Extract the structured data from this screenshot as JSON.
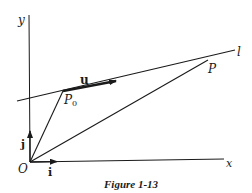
{
  "figure": {
    "caption": "Figure 1-13",
    "axes": {
      "x_label": "x",
      "y_label": "y",
      "origin_label": "O"
    },
    "unit_vectors": {
      "i_label": "i",
      "j_label": "j"
    },
    "line": {
      "label": "l",
      "direction_vector_label": "u"
    },
    "points": {
      "p0_label": "P",
      "p0_subscript": "0",
      "p_label": "P"
    },
    "colors": {
      "ink": "#1a1a1a",
      "background": "#ffffff"
    }
  }
}
